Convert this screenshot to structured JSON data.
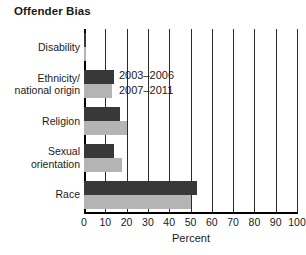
{
  "chart_data": {
    "type": "bar",
    "orientation": "horizontal",
    "title": "Offender Bias",
    "xlabel": "Percent",
    "ylabel": "",
    "xlim": [
      0,
      100
    ],
    "xticks": [
      0,
      10,
      20,
      30,
      40,
      50,
      60,
      70,
      80,
      90,
      100
    ],
    "xtick_labels": [
      "0",
      "10",
      "20",
      "30",
      "40",
      "50",
      "60",
      "70",
      "80",
      "90",
      "100"
    ],
    "grid": "vertical",
    "legend_position": "inside-upper-left",
    "categories": [
      "Disability",
      "Ethnicity/\nnational origin",
      "Religion",
      "Sexual\norientation",
      "Race"
    ],
    "category_lines": [
      [
        "Disability"
      ],
      [
        "Ethnicity/",
        "national origin"
      ],
      [
        "Religion"
      ],
      [
        "Sexual",
        "orientation"
      ],
      [
        "Race"
      ]
    ],
    "series": [
      {
        "name": "2003–2006",
        "color": "#383838",
        "values": [
          1,
          14,
          17,
          14,
          53
        ]
      },
      {
        "name": "2007–2011",
        "color": "#b4b4b4",
        "values": [
          1,
          13,
          20,
          18,
          50
        ]
      }
    ]
  },
  "legend": {
    "entries": [
      {
        "label": "2003–2006",
        "color": "#383838"
      },
      {
        "label": "2007–2011",
        "color": "#b4b4b4"
      }
    ]
  },
  "colors": {
    "series_a": "#383838",
    "series_b": "#b4b4b4",
    "axis": "#000000",
    "grid": "#2b2b2b",
    "text": "#1a1a1a",
    "background": "#ffffff"
  }
}
